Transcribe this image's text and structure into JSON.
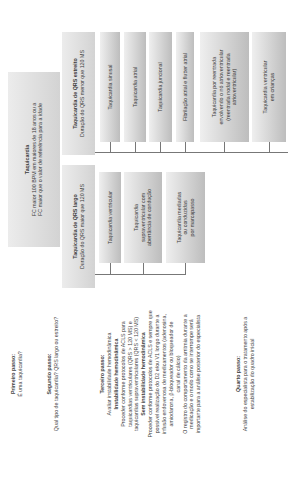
{
  "root": {
    "title": "Taquicardia",
    "lines": [
      "FC maior 100 BPM em maiores de 18 anos ou a",
      "FC maior que o valor de referência para a idade"
    ]
  },
  "narrow": {
    "title": "Taquicardia de QRS estreito",
    "subtitle": "Duração do QRS menor que 120 MS",
    "children": [
      {
        "lines": [
          "Taquicardia sinusal"
        ]
      },
      {
        "lines": [
          "Taquicardia atrial"
        ]
      },
      {
        "lines": [
          "Taquicardia juncional"
        ]
      },
      {
        "lines": [
          "Fibrilação atrial e flutter atrial"
        ]
      },
      {
        "lines": [
          "Taquicardia por reentrada",
          "envolvendo o nó atrioventricular",
          "(reentrada nodal e reentrada",
          "atrioventricular)"
        ]
      },
      {
        "lines": [
          "Taquicardia ventricular",
          "em crianças"
        ]
      }
    ]
  },
  "wide": {
    "title": "Taquicardia de QRS largo",
    "subtitle": "Duração do QRS maior que 120 MS",
    "children": [
      {
        "lines": [
          "Taquicardia ventricular"
        ]
      },
      {
        "lines": [
          "Taquicardia",
          "supraventricular com",
          "aberrância de condução"
        ]
      },
      {
        "lines": [
          "Taquicardia mediadas",
          "ou conduzidas",
          "por marcapasso"
        ]
      }
    ]
  },
  "steps": {
    "s1": {
      "title": "Primeiro passo:",
      "text": "É uma taquicardia?"
    },
    "s2": {
      "title": "Segundo passo:",
      "text": "Qual tipo de taquicardia? QRS largo ou estreito?"
    },
    "s3": {
      "title": "Terceiro passo:",
      "text": "Avaliar instabilidade hemodinâmica",
      "unstable_title": "Instabilidade hemodinâmica",
      "unstable_lines": [
        "Proceder conforme protocolos de ACLS para",
        "taquicardias ventriculares (QRS > 120 MS) e",
        "taquicardias supraventriculares (QRS < 120 MS)"
      ],
      "stable_title": "Sem instabilidade hemodinâmica",
      "stable_lines": [
        "Proceder conforme protocolos de ACLS e sempre que",
        "possível realização do D2 e/ou V1 longo durante a",
        "infusão endovenosa de medicamentos (adenosina,",
        "amiodarona, β-bloqueador ou bloqueador de",
        "canal de cálcio)",
        "O registro do comportamento da arritmia durante a",
        "medicação e o modo como se interrompe será",
        "importante para a análise posterior do especialista"
      ]
    },
    "s4": {
      "title": "Quarto passo:",
      "lines": [
        "Análise do especialista para o tratamento após a",
        "estabilização do quadro inicial"
      ]
    }
  }
}
